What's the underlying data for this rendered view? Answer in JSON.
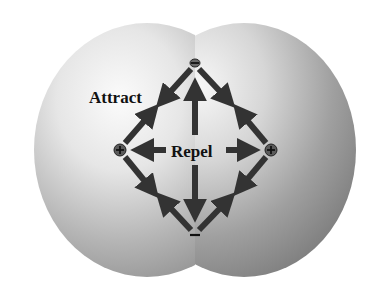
{
  "diagram": {
    "labels": {
      "attract": "Attract",
      "repel": "Repel"
    },
    "charges": [
      {
        "id": "top",
        "sign": "−",
        "type": "negative",
        "x": 195,
        "y": 63
      },
      {
        "id": "bottom",
        "sign": "−",
        "type": "negative",
        "x": 195,
        "y": 235
      },
      {
        "id": "left",
        "sign": "+",
        "type": "positive",
        "x": 120,
        "y": 150
      },
      {
        "id": "right",
        "sign": "+",
        "type": "positive",
        "x": 271,
        "y": 150
      }
    ],
    "relations": {
      "attract": [
        "top-left",
        "top-right",
        "bottom-left",
        "bottom-right"
      ],
      "repel": [
        "left-right",
        "top-bottom"
      ]
    },
    "colors": {
      "background": "#ffffff",
      "arrow": "#333333",
      "text": "#111111",
      "sphere_light": "#f4f4f4",
      "sphere_dark": "#8a8a8a"
    }
  }
}
